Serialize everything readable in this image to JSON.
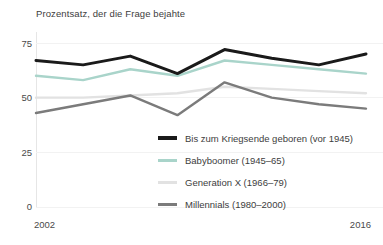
{
  "chart_data": {
    "type": "line",
    "title": "Prozentsatz, der die Frage bejahte",
    "xlabel": "",
    "ylabel": "",
    "x": [
      2002,
      2004,
      2006,
      2008,
      2010,
      2012,
      2014,
      2016
    ],
    "xlim": [
      2002,
      2016
    ],
    "ylim": [
      0,
      80
    ],
    "yticks": [
      0,
      25,
      50,
      75
    ],
    "ytick_labels": [
      "0",
      "25",
      "50",
      "75"
    ],
    "xtick_labels": [
      "2002",
      "2016"
    ],
    "xticks_shown": [
      2002,
      2016
    ],
    "grid": false,
    "legend_position": "inside-lower-right",
    "series": [
      {
        "name": "Bis zum Kriegsende geboren (vor 1945)",
        "color": "#1a1a1a",
        "width": 3,
        "values": [
          67,
          65,
          69,
          61,
          72,
          68,
          65,
          70
        ]
      },
      {
        "name": "Babyboomer (1945–65)",
        "color": "#a9d4ca",
        "width": 2.4,
        "values": [
          60,
          58,
          63,
          60,
          67,
          65,
          63,
          61
        ]
      },
      {
        "name": "Generation X (1966–79)",
        "color": "#e2e2e2",
        "width": 2.4,
        "values": [
          50,
          50,
          51,
          52,
          55,
          54,
          53,
          52
        ]
      },
      {
        "name": "Millennials (1980–2000)",
        "color": "#7b7b7b",
        "width": 2.4,
        "values": [
          43,
          47,
          51,
          42,
          57,
          50,
          47,
          45
        ]
      }
    ]
  },
  "legend": {
    "items": [
      {
        "label": "Bis zum Kriegsende geboren (vor 1945)",
        "color": "#1a1a1a"
      },
      {
        "label": "Babyboomer (1945–65)",
        "color": "#a9d4ca"
      },
      {
        "label": "Generation X (1966–79)",
        "color": "#e2e2e2"
      },
      {
        "label": "Millennials (1980–2000)",
        "color": "#7b7b7b"
      }
    ]
  },
  "axes": {
    "y_labels": [
      "75",
      "50",
      "25",
      "0"
    ],
    "x_start": "2002",
    "x_end": "2016"
  }
}
